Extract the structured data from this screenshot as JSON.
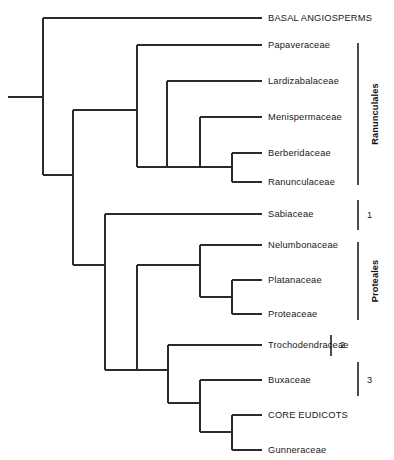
{
  "figure": {
    "type": "cladogram",
    "background_color": "#ffffff",
    "line_color": "#2b2b2b",
    "text_color": "#181818",
    "width": 394,
    "height": 460
  },
  "tips": [
    {
      "id": "basal-angiosperms",
      "label": "BASAL ANGIOSPERMS",
      "y": 18
    },
    {
      "id": "papaveraceae",
      "label": "Papaveraceae",
      "y": 45
    },
    {
      "id": "lardizabalaceae",
      "label": "Lardizabalaceae",
      "y": 81
    },
    {
      "id": "menispermaceae",
      "label": "Menispermaceae",
      "y": 117
    },
    {
      "id": "berberidaceae",
      "label": "Berberidaceae",
      "y": 153
    },
    {
      "id": "ranunculaceae",
      "label": "Ranunculaceae",
      "y": 182
    },
    {
      "id": "sabiaceae",
      "label": "Sabiaceae",
      "y": 214
    },
    {
      "id": "nelumbonaceae",
      "label": "Nelumbonaceae",
      "y": 245
    },
    {
      "id": "platanaceae",
      "label": "Platanaceae",
      "y": 280
    },
    {
      "id": "proteaceae",
      "label": "Proteaceae",
      "y": 314
    },
    {
      "id": "trochodendraceae",
      "label": "Trochodendraceae",
      "y": 345
    },
    {
      "id": "buxaceae",
      "label": "Buxaceae",
      "y": 380
    },
    {
      "id": "core-eudicots",
      "label": "CORE EUDICOTS",
      "y": 415
    },
    {
      "id": "gunneraceae",
      "label": "Gunneraceae",
      "y": 450
    }
  ],
  "brackets": [
    {
      "id": "ranunculales",
      "label": "Ranunculales",
      "orientation": "vertical",
      "y_top": 43,
      "y_bottom": 185
    },
    {
      "id": "note-1",
      "label": "1",
      "orientation": "horizontal",
      "y_top": 200,
      "y_bottom": 230
    },
    {
      "id": "proteales",
      "label": "Proteales",
      "orientation": "vertical",
      "y_top": 242,
      "y_bottom": 320
    },
    {
      "id": "note-2",
      "label": "2",
      "orientation": "horizontal",
      "y_top": 335,
      "y_bottom": 356
    },
    {
      "id": "note-3",
      "label": "3",
      "orientation": "horizontal",
      "y_top": 362,
      "y_bottom": 396
    }
  ],
  "tree_structure": {
    "root_stem_x_start": 8,
    "tip_x_end": 262,
    "nodes": [
      {
        "id": "root",
        "x": 43,
        "child_tops": 18,
        "child_bottoms": 175
      },
      {
        "id": "eudicots",
        "x": 73,
        "child_tops": 110,
        "child_bottoms": 265
      },
      {
        "id": "ranunculales-node",
        "x": 137,
        "child_tops": 45,
        "child_bottoms": 175
      },
      {
        "id": "lardizabalaceae-clade",
        "x": 167,
        "child_tops": 81,
        "child_bottoms": 167
      },
      {
        "id": "menispermaceae-clade",
        "x": 200,
        "child_tops": 117,
        "child_bottoms": 167
      },
      {
        "id": "berberidaceae-clade",
        "x": 232,
        "child_tops": 153,
        "child_bottoms": 182
      },
      {
        "id": "proteales-plus",
        "x": 105,
        "child_tops": 214,
        "child_bottoms": 370
      },
      {
        "id": "proteales-node",
        "x": 137,
        "child_tops": 265,
        "child_bottoms": 370
      },
      {
        "id": "nelumbo-clade",
        "x": 200,
        "child_tops": 245,
        "child_bottoms": 297
      },
      {
        "id": "platanus-clade",
        "x": 232,
        "child_tops": 280,
        "child_bottoms": 314
      },
      {
        "id": "trochodendron-clade",
        "x": 168,
        "child_tops": 345,
        "child_bottoms": 415
      },
      {
        "id": "buxaceae-clade",
        "x": 200,
        "child_tops": 380,
        "child_bottoms": 432
      },
      {
        "id": "core-clade",
        "x": 232,
        "child_tops": 415,
        "child_bottoms": 450
      }
    ]
  }
}
